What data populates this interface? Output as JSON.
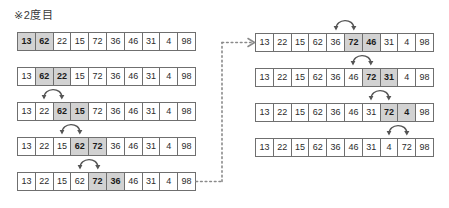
{
  "figure": {
    "title": "※2度目",
    "type": "bubble-sort-pass-diagram",
    "cell_count": 10,
    "colors": {
      "cell_border": "#6f6f6f",
      "highlight_fill": "#d2d2d2",
      "cell_fill": "#ffffff",
      "arrow": "#555555",
      "dotted_connector": "#8a8a8a",
      "text": "#2b2b2b"
    },
    "left_column": {
      "rows": [
        {
          "values": [
            "13",
            "62",
            "22",
            "15",
            "72",
            "36",
            "46",
            "31",
            "4",
            "98"
          ],
          "highlight": [
            0,
            1
          ],
          "swap_arrow": null
        },
        {
          "values": [
            "13",
            "62",
            "22",
            "15",
            "72",
            "36",
            "46",
            "31",
            "4",
            "98"
          ],
          "highlight": [
            1,
            2
          ],
          "swap_arrow": null
        },
        {
          "values": [
            "13",
            "22",
            "62",
            "15",
            "72",
            "36",
            "46",
            "31",
            "4",
            "98"
          ],
          "highlight": [
            2,
            3
          ],
          "swap_arrow": [
            1,
            2
          ]
        },
        {
          "values": [
            "13",
            "22",
            "15",
            "62",
            "72",
            "36",
            "46",
            "31",
            "4",
            "98"
          ],
          "highlight": [
            3,
            4
          ],
          "swap_arrow": [
            2,
            3
          ]
        },
        {
          "values": [
            "13",
            "22",
            "15",
            "62",
            "72",
            "36",
            "46",
            "31",
            "4",
            "98"
          ],
          "highlight": [
            4,
            5
          ],
          "swap_arrow": [
            3,
            4
          ]
        }
      ]
    },
    "right_column": {
      "rows": [
        {
          "values": [
            "13",
            "22",
            "15",
            "62",
            "36",
            "72",
            "46",
            "31",
            "4",
            "98"
          ],
          "highlight": [
            5,
            6
          ],
          "swap_arrow": [
            4,
            5
          ]
        },
        {
          "values": [
            "13",
            "22",
            "15",
            "62",
            "36",
            "46",
            "72",
            "31",
            "4",
            "98"
          ],
          "highlight": [
            6,
            7
          ],
          "swap_arrow": [
            5,
            6
          ]
        },
        {
          "values": [
            "13",
            "22",
            "15",
            "62",
            "36",
            "46",
            "31",
            "72",
            "4",
            "98"
          ],
          "highlight": [
            7,
            8
          ],
          "swap_arrow": [
            6,
            7
          ]
        },
        {
          "values": [
            "13",
            "22",
            "15",
            "62",
            "36",
            "46",
            "31",
            "4",
            "72",
            "98"
          ],
          "highlight": [],
          "swap_arrow": [
            7,
            8
          ]
        }
      ]
    },
    "connector": {
      "name": "dotted-flow-connector",
      "from": "left-column-last-row",
      "to": "right-column-first-row"
    }
  }
}
